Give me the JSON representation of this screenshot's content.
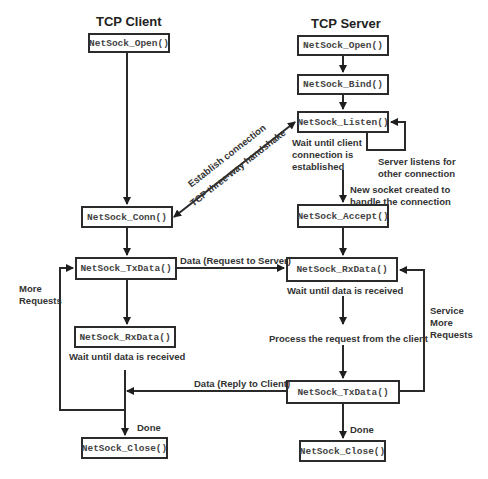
{
  "client": {
    "title": "TCP Client",
    "steps": {
      "open": "NetSock_Open()",
      "conn": "NetSock_Conn()",
      "txdata": "NetSock_TxData()",
      "rxdata": "NetSock_RxData()",
      "close": "NetSock_Close()"
    },
    "notes": {
      "rx_wait": "Wait until data is received",
      "more_requests_1": "More",
      "more_requests_2": "Requests",
      "done": "Done"
    }
  },
  "server": {
    "title": "TCP Server",
    "steps": {
      "open": "NetSock_Open()",
      "bind": "NetSock_Bind()",
      "listen": "NetSock_Listen()",
      "accept": "NetSock_Accept()",
      "rxdata": "NetSock_RxData()",
      "txdata": "NetSock_TxData()",
      "close": "NetSock_Close()"
    },
    "notes": {
      "listen_wait_1": "Wait until client",
      "listen_wait_2": "connection  is",
      "listen_wait_3": "established",
      "listens_other_1": "Server listens for",
      "listens_other_2": "other connection",
      "new_socket_1": "New socket created to",
      "new_socket_2": "handle the connection",
      "rx_wait": "Wait until data is received",
      "process": "Process the request from the client",
      "service_1": "Service",
      "service_2": "More",
      "service_3": "Requests",
      "done": "Done"
    }
  },
  "connections": {
    "handshake_1": "Establish connection",
    "handshake_2": "TCP three-way handshake",
    "request": "Data (Request to Server)",
    "reply": "Data (Reply to Client)"
  }
}
